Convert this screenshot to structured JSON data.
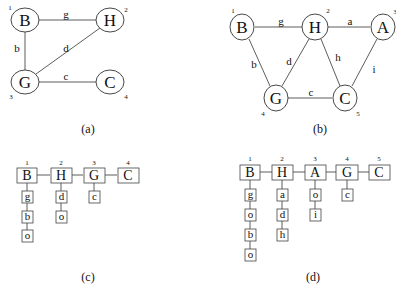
{
  "panels": {
    "a": {
      "caption": "(a)",
      "nodes": [
        {
          "id": "B",
          "label": "B",
          "index": "1"
        },
        {
          "id": "H",
          "label": "H",
          "index": "2"
        },
        {
          "id": "G",
          "label": "G",
          "index": "3"
        },
        {
          "id": "C",
          "label": "C",
          "index": "4"
        }
      ],
      "edges": [
        {
          "from": "B",
          "to": "H",
          "label": "g"
        },
        {
          "from": "B",
          "to": "G",
          "label": "b"
        },
        {
          "from": "G",
          "to": "H",
          "label": "d"
        },
        {
          "from": "G",
          "to": "C",
          "label": "c"
        }
      ]
    },
    "b": {
      "caption": "(b)",
      "nodes": [
        {
          "id": "B",
          "label": "B",
          "index": "1"
        },
        {
          "id": "H",
          "label": "H",
          "index": "2"
        },
        {
          "id": "A",
          "label": "A",
          "index": "3"
        },
        {
          "id": "G",
          "label": "G",
          "index": "4"
        },
        {
          "id": "C",
          "label": "C",
          "index": "5"
        }
      ],
      "edges": [
        {
          "from": "B",
          "to": "H",
          "label": "g"
        },
        {
          "from": "H",
          "to": "A",
          "label": "a"
        },
        {
          "from": "B",
          "to": "G",
          "label": "b"
        },
        {
          "from": "G",
          "to": "H",
          "label": "d"
        },
        {
          "from": "H",
          "to": "C",
          "label": "h"
        },
        {
          "from": "A",
          "to": "C",
          "label": "i"
        },
        {
          "from": "G",
          "to": "C",
          "label": "c"
        }
      ]
    },
    "c": {
      "caption": "(c)",
      "columns": [
        {
          "label": "B",
          "index": "1",
          "children": [
            "g",
            "b",
            "o"
          ]
        },
        {
          "label": "H",
          "index": "2",
          "children": [
            "d",
            "o"
          ]
        },
        {
          "label": "G",
          "index": "3",
          "children": [
            "c"
          ]
        },
        {
          "label": "C",
          "index": "4",
          "children": []
        }
      ]
    },
    "d": {
      "caption": "(d)",
      "columns": [
        {
          "label": "B",
          "index": "1",
          "children": [
            "g",
            "o",
            "b",
            "o"
          ]
        },
        {
          "label": "H",
          "index": "2",
          "children": [
            "a",
            "d",
            "h"
          ]
        },
        {
          "label": "A",
          "index": "3",
          "children": [
            "o",
            "i"
          ]
        },
        {
          "label": "G",
          "index": "4",
          "children": [
            "c"
          ]
        },
        {
          "label": "C",
          "index": "5",
          "children": []
        }
      ]
    }
  }
}
